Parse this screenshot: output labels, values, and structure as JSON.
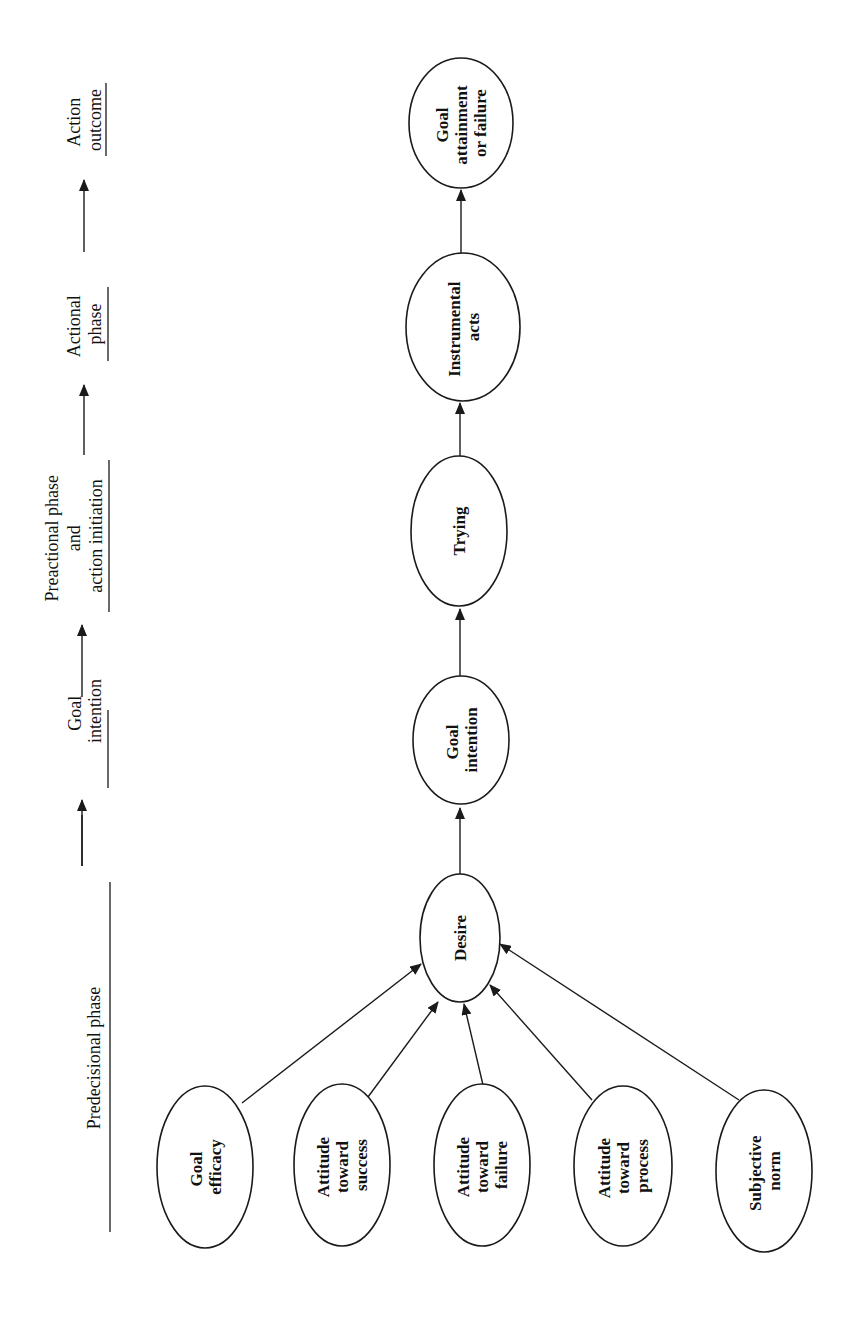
{
  "diagram": {
    "orientation": "rotated-90-ccw",
    "phases": [
      {
        "id": "predecisional",
        "lines": [
          "Predecisional phase"
        ]
      },
      {
        "id": "goal-intention",
        "lines": [
          "Goal",
          "intention"
        ]
      },
      {
        "id": "preactional",
        "lines": [
          "Preactional phase",
          "and",
          "action initiation"
        ]
      },
      {
        "id": "actional",
        "lines": [
          "Actional",
          "phase"
        ]
      },
      {
        "id": "action-outcome",
        "lines": [
          "Action",
          "outcome"
        ]
      }
    ],
    "nodes": {
      "desire": {
        "lines": [
          "Desire"
        ]
      },
      "goal_intention": {
        "lines": [
          "Goal",
          "intention"
        ]
      },
      "trying": {
        "lines": [
          "Trying"
        ]
      },
      "instrumental_acts": {
        "lines": [
          "Instrumental",
          "acts"
        ]
      },
      "goal_attainment": {
        "lines": [
          "Goal",
          "attainment",
          "or failure"
        ]
      },
      "goal_efficacy": {
        "lines": [
          "Goal",
          "efficacy"
        ]
      },
      "attitude_success": {
        "lines": [
          "Attitude",
          "toward",
          "success"
        ]
      },
      "attitude_failure": {
        "lines": [
          "Attitude",
          "toward",
          "failure"
        ]
      },
      "attitude_process": {
        "lines": [
          "Attitude",
          "toward",
          "process"
        ]
      },
      "subjective_norm": {
        "lines": [
          "Subjective",
          "norm"
        ]
      }
    },
    "edges": [
      {
        "from": "goal_efficacy",
        "to": "desire"
      },
      {
        "from": "attitude_success",
        "to": "desire"
      },
      {
        "from": "attitude_failure",
        "to": "desire"
      },
      {
        "from": "attitude_process",
        "to": "desire"
      },
      {
        "from": "subjective_norm",
        "to": "desire"
      },
      {
        "from": "desire",
        "to": "goal_intention"
      },
      {
        "from": "goal_intention",
        "to": "trying"
      },
      {
        "from": "trying",
        "to": "instrumental_acts"
      },
      {
        "from": "instrumental_acts",
        "to": "goal_attainment"
      }
    ],
    "colors": {
      "stroke": "#1a1a1a",
      "background": "#ffffff",
      "text": "#111111"
    }
  }
}
